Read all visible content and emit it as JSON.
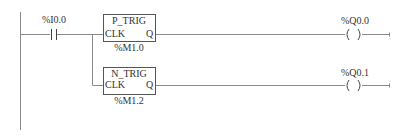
{
  "diagram": {
    "type": "ladder-logic",
    "rungs": [
      {
        "contact": {
          "address": "%I0.0",
          "type": "normally-open"
        },
        "block": {
          "name": "P_TRIG",
          "input": "CLK",
          "output": "Q",
          "memory": "%M1.0"
        },
        "coil": {
          "address": "%Q0.0",
          "type": "output"
        }
      },
      {
        "block": {
          "name": "N_TRIG",
          "input": "CLK",
          "output": "Q",
          "memory": "%M1.2"
        },
        "coil": {
          "address": "%Q0.1",
          "type": "output"
        }
      }
    ]
  },
  "colors": {
    "wire": "#8a8a8a",
    "box": "#555555",
    "text": "#333333",
    "background": "#ffffff"
  }
}
